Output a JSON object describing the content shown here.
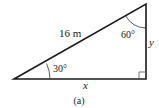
{
  "figure": {
    "caption": "(a)",
    "hypotenuse_label": "16 m",
    "angle_bottom_left": "30°",
    "angle_top": "60°",
    "side_right_label": "y",
    "side_bottom_label": "x"
  },
  "colors": {
    "stroke": "#1a1a1a",
    "background": "#ffffff"
  }
}
